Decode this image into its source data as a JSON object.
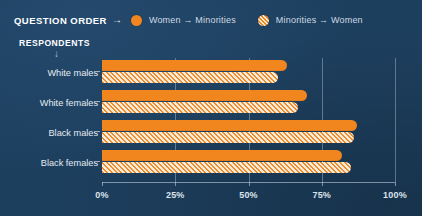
{
  "legend": {
    "title": "QUESTION ORDER",
    "arrow_icon": "right-arrow",
    "items": [
      {
        "label": "Women → Minorities",
        "marker": "solid-circle",
        "color": "#f2861e"
      },
      {
        "label": "Minorities → Women",
        "marker": "hatched-circle",
        "color": "#f6e9d6"
      }
    ]
  },
  "respondents": {
    "label": "RESPONDENTS",
    "arrow_icon": "down-arrow"
  },
  "chart_data": {
    "type": "bar",
    "orientation": "horizontal",
    "title": "",
    "xlabel": "",
    "ylabel": "RESPONDENTS",
    "xlim": [
      0,
      100
    ],
    "grid": true,
    "legend_position": "top",
    "categories": [
      "White males",
      "White females",
      "Black males",
      "Black females"
    ],
    "tick_labels": [
      "0%",
      "25%",
      "50%",
      "75%",
      "100%"
    ],
    "tick_values": [
      0,
      25,
      50,
      75,
      100
    ],
    "series": [
      {
        "name": "Women → Minorities",
        "color": "#f2861e",
        "style": "solid",
        "values": [
          63,
          70,
          87,
          82
        ]
      },
      {
        "name": "Minorities → Women",
        "color": "#f6e9d6",
        "style": "hatched",
        "values": [
          60,
          67,
          86,
          85
        ]
      }
    ]
  }
}
